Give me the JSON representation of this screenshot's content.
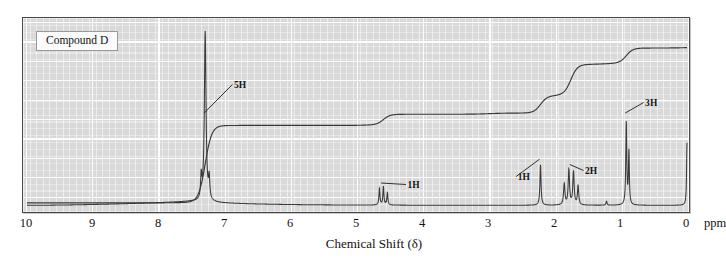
{
  "figure": {
    "compound_label": "Compound D",
    "axis_title": "Chemical Shift (δ)",
    "ppm_unit": "ppm",
    "background_color": "#d9d9d9",
    "frame_color": "#4a4a4a",
    "trace_color": "#3a3a3a",
    "gridline_color": "#ffffff"
  },
  "axis": {
    "min_ppm": 0,
    "max_ppm": 10,
    "direction": "right-to-left",
    "ticks": [
      {
        "value": 10,
        "label": "10"
      },
      {
        "value": 9,
        "label": "9"
      },
      {
        "value": 8,
        "label": "8"
      },
      {
        "value": 7,
        "label": "7"
      },
      {
        "value": 6,
        "label": "6"
      },
      {
        "value": 5,
        "label": "5"
      },
      {
        "value": 4,
        "label": "4"
      },
      {
        "value": 3,
        "label": "3"
      },
      {
        "value": 2,
        "label": "2"
      },
      {
        "value": 1,
        "label": "1"
      },
      {
        "value": 0,
        "label": "0"
      }
    ]
  },
  "annotations": [
    {
      "text": "5H",
      "ppm": 7.3,
      "label_x_ppm": 6.85,
      "label_y": 86
    },
    {
      "text": "1H",
      "ppm": 4.62,
      "label_x_ppm": 4.22,
      "label_y": 186
    },
    {
      "text": "1H",
      "ppm": 2.22,
      "label_x_ppm": 2.55,
      "label_y": 178
    },
    {
      "text": "2H",
      "ppm": 1.76,
      "label_x_ppm": 1.53,
      "label_y": 172
    },
    {
      "text": "3H",
      "ppm": 0.92,
      "label_x_ppm": 0.62,
      "label_y": 104
    }
  ],
  "chart_data": {
    "type": "line",
    "title": "Compound D",
    "xlabel": "Chemical Shift (δ)",
    "ylabel": "",
    "xlim": [
      10,
      0
    ],
    "ylim": [
      0,
      1
    ],
    "grid": true,
    "legend": "none",
    "series": [
      {
        "name": "NMR spectrum",
        "peaks": [
          {
            "ppm": 7.3,
            "height": 0.965,
            "width": 0.03,
            "integration_H": 5,
            "multiplicity": "m",
            "assignment": "aromatic"
          },
          {
            "ppm": 7.36,
            "height": 0.13,
            "width": 0.022,
            "integration_H": 0,
            "multiplicity": "m",
            "assignment": "aromatic shoulder"
          },
          {
            "ppm": 7.24,
            "height": 0.12,
            "width": 0.022,
            "integration_H": 0,
            "multiplicity": "m",
            "assignment": "aromatic shoulder"
          },
          {
            "ppm": 4.66,
            "height": 0.095,
            "width": 0.018,
            "integration_H": 1,
            "multiplicity": "m",
            "assignment": "methine"
          },
          {
            "ppm": 4.6,
            "height": 0.105,
            "width": 0.018,
            "integration_H": 0,
            "multiplicity": "m",
            "assignment": "methine"
          },
          {
            "ppm": 4.54,
            "height": 0.07,
            "width": 0.018,
            "integration_H": 0,
            "multiplicity": "m",
            "assignment": "methine"
          },
          {
            "ppm": 2.22,
            "height": 0.23,
            "width": 0.02,
            "integration_H": 1,
            "multiplicity": "s",
            "assignment": "OH / CH"
          },
          {
            "ppm": 1.86,
            "height": 0.12,
            "width": 0.024,
            "integration_H": 0,
            "multiplicity": "m",
            "assignment": "methylene"
          },
          {
            "ppm": 1.79,
            "height": 0.2,
            "width": 0.024,
            "integration_H": 2,
            "multiplicity": "m",
            "assignment": "methylene"
          },
          {
            "ppm": 1.72,
            "height": 0.19,
            "width": 0.024,
            "integration_H": 0,
            "multiplicity": "m",
            "assignment": "methylene"
          },
          {
            "ppm": 1.65,
            "height": 0.11,
            "width": 0.022,
            "integration_H": 0,
            "multiplicity": "m",
            "assignment": "methylene"
          },
          {
            "ppm": 1.22,
            "height": 0.022,
            "width": 0.018,
            "integration_H": 0,
            "multiplicity": "s",
            "assignment": "minor"
          },
          {
            "ppm": 0.92,
            "height": 0.47,
            "width": 0.018,
            "integration_H": 3,
            "multiplicity": "t",
            "assignment": "methyl"
          },
          {
            "ppm": 0.88,
            "height": 0.3,
            "width": 0.016,
            "integration_H": 0,
            "multiplicity": "t",
            "assignment": "methyl"
          },
          {
            "ppm": 0.0,
            "height": 0.355,
            "width": 0.015,
            "integration_H": 0,
            "multiplicity": "s",
            "assignment": "TMS reference"
          }
        ]
      },
      {
        "name": "Integration trace",
        "type": "step",
        "steps": [
          {
            "ppm": 10.0,
            "level": 0.03
          },
          {
            "ppm": 7.55,
            "level": 0.035
          },
          {
            "ppm": 7.3,
            "level": 0.48,
            "rise_H": 5
          },
          {
            "ppm": 4.8,
            "level": 0.485
          },
          {
            "ppm": 4.6,
            "level": 0.545,
            "rise_H": 1
          },
          {
            "ppm": 3.0,
            "level": 0.552
          },
          {
            "ppm": 2.22,
            "level": 0.65,
            "rise_H": 1
          },
          {
            "ppm": 1.95,
            "level": 0.66
          },
          {
            "ppm": 1.76,
            "level": 0.835,
            "rise_H": 2
          },
          {
            "ppm": 1.2,
            "level": 0.843
          },
          {
            "ppm": 0.92,
            "level": 0.93,
            "rise_H": 3
          },
          {
            "ppm": 0.0,
            "level": 0.935
          }
        ]
      }
    ]
  }
}
